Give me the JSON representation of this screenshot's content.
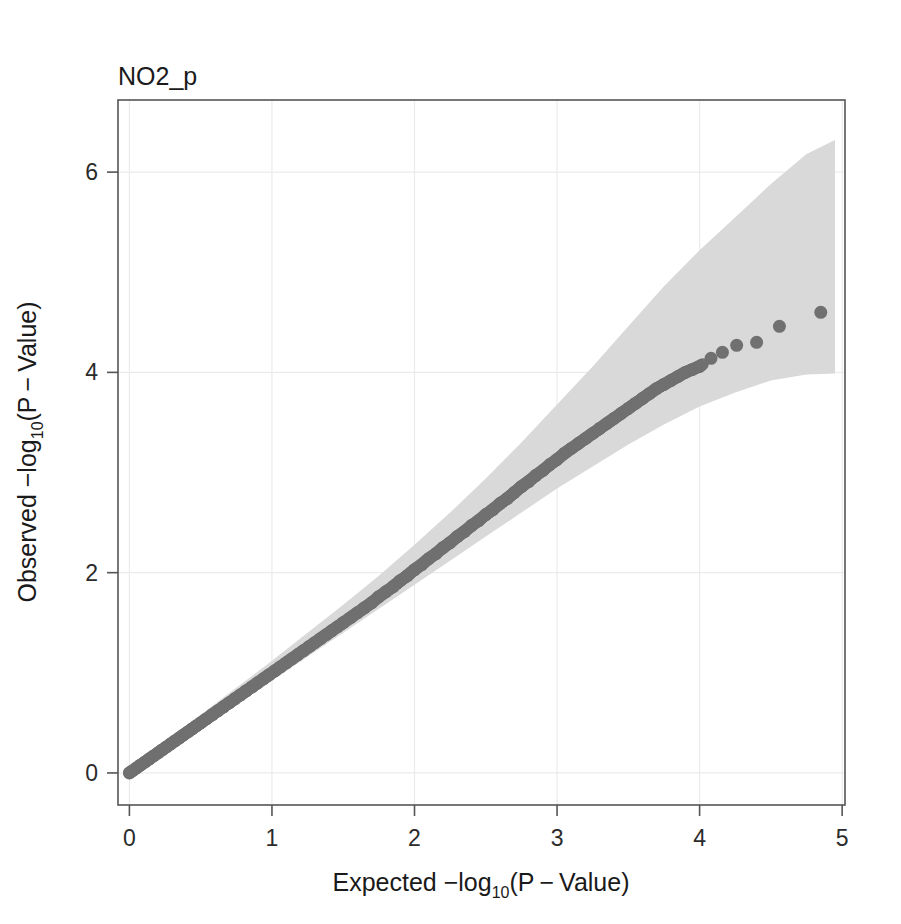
{
  "figure": {
    "title": "NO2_p",
    "background_color": "#ffffff",
    "point_color": "#707070",
    "band_color": "#d9d9d9",
    "axis_color": "#555555",
    "grid_color": "#ebebeb"
  },
  "axes": {
    "x": {
      "label_prefix": "Expected  −log",
      "label_sub": "10",
      "label_suffix": "(P − Value)",
      "ticks": [
        "0",
        "1",
        "2",
        "3",
        "4",
        "5"
      ],
      "tick_values": [
        0,
        1,
        2,
        3,
        4,
        5
      ],
      "range": [
        -0.08,
        5.02
      ]
    },
    "y": {
      "label_prefix": "Observed  −log",
      "label_sub": "10",
      "label_suffix": "(P − Value)",
      "ticks": [
        "0",
        "2",
        "4",
        "6"
      ],
      "tick_values": [
        0,
        2,
        4,
        6
      ],
      "range": [
        -0.32,
        6.72
      ]
    },
    "grid": "on",
    "legend": "none"
  },
  "chart_data": {
    "type": "scatter",
    "title": "NO2_p",
    "xlabel": "Expected -log10(P-Value)",
    "ylabel": "Observed -log10(P-Value)",
    "xlim": [
      -0.08,
      5.02
    ],
    "ylim": [
      -0.32,
      6.72
    ],
    "grid": true,
    "legend_position": "none",
    "series": [
      {
        "name": "observed p-values",
        "marker": "filled-circle",
        "color": "#707070",
        "x": [
          0.0,
          0.02,
          0.05,
          0.08,
          0.11,
          0.14,
          0.17,
          0.2,
          0.23,
          0.26,
          0.29,
          0.32,
          0.35,
          0.38,
          0.41,
          0.44,
          0.47,
          0.5,
          0.54,
          0.58,
          0.62,
          0.66,
          0.7,
          0.74,
          0.78,
          0.82,
          0.86,
          0.9,
          0.94,
          0.98,
          1.02,
          1.06,
          1.1,
          1.14,
          1.18,
          1.22,
          1.26,
          1.3,
          1.34,
          1.38,
          1.42,
          1.46,
          1.5,
          1.55,
          1.6,
          1.65,
          1.7,
          1.75,
          1.8,
          1.85,
          1.9,
          1.95,
          2.0,
          2.05,
          2.1,
          2.15,
          2.2,
          2.25,
          2.3,
          2.35,
          2.4,
          2.45,
          2.5,
          2.55,
          2.6,
          2.65,
          2.7,
          2.75,
          2.8,
          2.85,
          2.9,
          2.95,
          3.0,
          3.05,
          3.1,
          3.15,
          3.2,
          3.25,
          3.3,
          3.35,
          3.4,
          3.45,
          3.5,
          3.55,
          3.6,
          3.65,
          3.7,
          3.75,
          3.8,
          3.85,
          3.9,
          3.95,
          4.0,
          4.08,
          4.16,
          4.26,
          4.4,
          4.56,
          4.85
        ],
        "y": [
          0.0,
          0.02,
          0.05,
          0.08,
          0.11,
          0.14,
          0.17,
          0.2,
          0.23,
          0.26,
          0.29,
          0.32,
          0.35,
          0.38,
          0.41,
          0.44,
          0.47,
          0.5,
          0.54,
          0.58,
          0.62,
          0.66,
          0.7,
          0.74,
          0.78,
          0.82,
          0.86,
          0.9,
          0.94,
          0.98,
          1.02,
          1.06,
          1.1,
          1.14,
          1.18,
          1.22,
          1.26,
          1.3,
          1.34,
          1.38,
          1.42,
          1.46,
          1.5,
          1.55,
          1.6,
          1.65,
          1.7,
          1.76,
          1.81,
          1.86,
          1.92,
          1.97,
          2.03,
          2.08,
          2.14,
          2.19,
          2.25,
          2.3,
          2.36,
          2.41,
          2.47,
          2.52,
          2.58,
          2.63,
          2.69,
          2.74,
          2.8,
          2.86,
          2.91,
          2.97,
          3.02,
          3.08,
          3.13,
          3.19,
          3.24,
          3.29,
          3.34,
          3.39,
          3.44,
          3.49,
          3.54,
          3.59,
          3.64,
          3.69,
          3.74,
          3.79,
          3.84,
          3.88,
          3.92,
          3.96,
          4.0,
          4.03,
          4.06,
          4.14,
          4.2,
          4.27,
          4.3,
          4.46,
          4.6
        ]
      }
    ],
    "confidence_band": {
      "name": "pointwise confidence band",
      "fill": "#d9d9d9",
      "x": [
        0.0,
        0.25,
        0.5,
        0.75,
        1.0,
        1.25,
        1.5,
        1.75,
        2.0,
        2.25,
        2.5,
        2.75,
        3.0,
        3.25,
        3.5,
        3.75,
        4.0,
        4.25,
        4.5,
        4.75,
        4.95
      ],
      "upper": [
        0.06,
        0.32,
        0.58,
        0.85,
        1.12,
        1.4,
        1.68,
        1.97,
        2.28,
        2.6,
        2.94,
        3.3,
        3.68,
        4.06,
        4.46,
        4.86,
        5.22,
        5.55,
        5.88,
        6.18,
        6.32
      ],
      "lower": [
        0.0,
        0.2,
        0.44,
        0.68,
        0.92,
        1.16,
        1.4,
        1.64,
        1.88,
        2.12,
        2.36,
        2.6,
        2.84,
        3.06,
        3.28,
        3.48,
        3.66,
        3.8,
        3.92,
        3.98,
        3.99
      ]
    }
  }
}
